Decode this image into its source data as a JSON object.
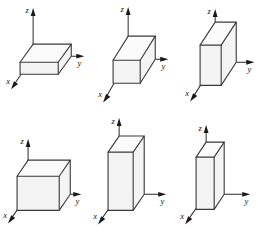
{
  "figure": {
    "background_color": "#ffffff",
    "line_color": "#3a3a3a",
    "axis_color": "#2b2b2b",
    "hidden_edge_color": "#8e8e8e",
    "label_color": "#141414",
    "rows": 2,
    "columns": 3,
    "panel_count": 6
  },
  "axes": {
    "x_label": "x",
    "y_label": "y",
    "z_label": "z"
  },
  "panels": [
    {
      "id": "panel-1",
      "position": "top-left",
      "labels": {
        "x": "x",
        "y": "y",
        "z": "z"
      },
      "box": {
        "width_y": 1.0,
        "depth_x": 0.52,
        "height_z": 0.26
      },
      "description": "wide flat box, low height"
    },
    {
      "id": "panel-2",
      "position": "top-middle",
      "labels": {
        "x": "x",
        "y": "y",
        "z": "z"
      },
      "box": {
        "width_y": 1.0,
        "depth_x": 0.52,
        "height_z": 0.46
      },
      "description": "wide box, medium height"
    },
    {
      "id": "panel-3",
      "position": "top-right",
      "labels": {
        "x": "x",
        "y": "y",
        "z": "z"
      },
      "box": {
        "width_y": 0.62,
        "depth_x": 0.52,
        "height_z": 0.78
      },
      "description": "narrow tall box"
    },
    {
      "id": "panel-4",
      "position": "bottom-left",
      "labels": {
        "x": "x",
        "y": "y",
        "z": "z"
      },
      "box": {
        "width_y": 1.0,
        "depth_x": 0.46,
        "height_z": 0.52
      },
      "description": "wide box, flat top"
    },
    {
      "id": "panel-5",
      "position": "bottom-middle",
      "labels": {
        "x": "x",
        "y": "y",
        "z": "z"
      },
      "box": {
        "width_y": 0.46,
        "depth_x": 0.4,
        "height_z": 1.0
      },
      "description": "tall column box"
    },
    {
      "id": "panel-6",
      "position": "bottom-right",
      "labels": {
        "x": "x",
        "y": "y",
        "z": "z"
      },
      "box": {
        "width_y": 0.34,
        "depth_x": 0.34,
        "height_z": 1.0
      },
      "description": "slim tall column box"
    }
  ]
}
